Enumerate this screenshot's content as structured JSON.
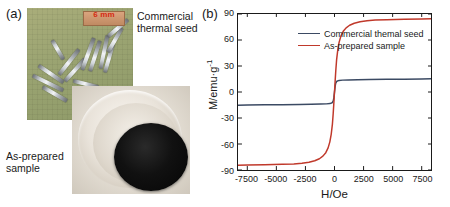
{
  "figure": {
    "panel_a": {
      "tag": "(a)",
      "scale_label": "6 mm",
      "label_commercial": "Commercial thermal seed",
      "label_asprepared": "As-prepared sample",
      "colors": {
        "background": "#9ba472",
        "scalebar": "#c08a62",
        "scale_text": "#d42a12",
        "powder": "#0a0a0a"
      }
    },
    "panel_b": {
      "tag": "(b)"
    }
  },
  "chart_data": {
    "type": "line",
    "title": "",
    "xlabel": "H/Oe",
    "ylabel": "M/emu·g⁻¹",
    "ylabel_base": "M/emu·g",
    "ylabel_exp": "-1",
    "xlim": [
      -8300,
      8300
    ],
    "ylim": [
      -90,
      90
    ],
    "xticks": [
      -7500,
      -5000,
      -2500,
      0,
      2500,
      5000,
      7500
    ],
    "xtick_labels": [
      "-7500",
      "-5000",
      "-2500",
      "0",
      "2500",
      "5000",
      "7500"
    ],
    "yticks": [
      90,
      60,
      30,
      0,
      -30,
      -60,
      -90
    ],
    "ytick_labels": [
      "90",
      "60",
      "30",
      "0",
      "-30",
      "-60",
      "-90"
    ],
    "grid": false,
    "legend_position": "top-left",
    "series": [
      {
        "name": "Commercial themal seed",
        "color": "#3b4a63",
        "saturation_magnetization": 16,
        "x": [
          -8300,
          -7500,
          -6000,
          -4500,
          -3000,
          -2000,
          -1200,
          -700,
          -400,
          -200,
          -100,
          -50,
          0,
          50,
          100,
          200,
          400,
          700,
          1200,
          2000,
          3000,
          4500,
          6000,
          7500,
          8300
        ],
        "y": [
          -15.2,
          -15.0,
          -14.8,
          -14.6,
          -14.3,
          -14.1,
          -13.9,
          -13.7,
          -13.4,
          -12.4,
          -10.0,
          -6.0,
          0,
          6.0,
          10.0,
          12.4,
          13.4,
          13.7,
          13.9,
          14.1,
          14.3,
          14.6,
          14.8,
          15.0,
          15.2
        ]
      },
      {
        "name": "As-prepared sample",
        "color": "#c0392b",
        "saturation_magnetization": 85,
        "x": [
          -8300,
          -7500,
          -6000,
          -4500,
          -3500,
          -2800,
          -2200,
          -1700,
          -1300,
          -1000,
          -750,
          -550,
          -400,
          -280,
          -180,
          -110,
          -60,
          -25,
          0,
          25,
          60,
          110,
          180,
          280,
          400,
          550,
          750,
          1000,
          1300,
          1700,
          2200,
          2800,
          3500,
          4500,
          6000,
          7500,
          8300
        ],
        "y": [
          -84.5,
          -84.3,
          -84.0,
          -83.5,
          -83.0,
          -82.2,
          -81.0,
          -79.3,
          -77.0,
          -74.0,
          -70.0,
          -64.5,
          -57.5,
          -48.5,
          -37.0,
          -24.5,
          -13.5,
          -5.5,
          0,
          5.5,
          13.5,
          24.5,
          37.0,
          48.5,
          57.5,
          64.5,
          70.0,
          74.0,
          77.0,
          79.3,
          81.0,
          82.2,
          83.0,
          83.5,
          84.0,
          84.3,
          84.5
        ]
      }
    ]
  }
}
